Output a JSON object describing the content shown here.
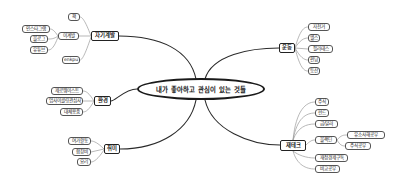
{
  "mindmap": {
    "center": "내가 좋아하고 관심이 있는 것들",
    "branches": {
      "self_dev": {
        "label": "자기계발",
        "children": {
          "book": "책",
          "sub": "이계발",
          "instagram": "인스타그램",
          "blog": "블로그",
          "youtube": "유튜브",
          "enkpu": "enkpu"
        }
      },
      "environment": {
        "label": "환경",
        "children": {
          "zerowaste": "제로웨이스트",
          "upcycling": "업사이클링관심사",
          "alternatives": "대체용품"
        }
      },
      "hobby": {
        "label": "취미",
        "children": {
          "leisure": "여가활동",
          "choir": "합창비",
          "cooking": "요리"
        }
      },
      "exercise": {
        "label": "운동",
        "children": {
          "bicycle": "자전거",
          "health": "헬스",
          "pilates": "필라테스",
          "running": "런닝",
          "hiking": "등산"
        }
      },
      "finance": {
        "label": "재테크",
        "children": {
          "stocks": "주식",
          "fund": "펀드",
          "gold_dollar": "금/달러",
          "blackdin": "블랙딘",
          "study1": "유소사해공부",
          "study2": "주식공부",
          "subscription": "재정경제구독",
          "compare": "비교공부"
        }
      }
    }
  },
  "colors": {
    "line": "#333333",
    "leaf_line": "#888888",
    "border": "#222222",
    "background": "#ffffff"
  }
}
